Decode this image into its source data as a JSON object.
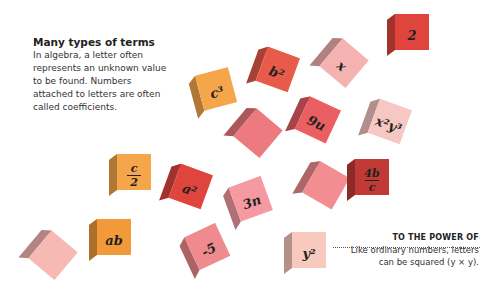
{
  "intro": {
    "title": "Many types of terms",
    "body": "In algebra, a letter often represents an unknown value to be found. Numbers attached to letters are often called coefficients."
  },
  "annotation": {
    "title": "TO THE POWER OF",
    "body": "Like ordinary numbers, letters can be squared (y × y)."
  },
  "cubes": [
    {
      "label": "2",
      "color": "#e0453d",
      "x": 385,
      "y": 12,
      "rot": 0
    },
    {
      "label": "b²",
      "color": "#e85a4a",
      "x": 250,
      "y": 48,
      "rot": 20
    },
    {
      "label": "x",
      "color": "#f4b3b0",
      "x": 316,
      "y": 40,
      "rot": 40
    },
    {
      "label": "c³",
      "color": "#f5a64a",
      "x": 190,
      "y": 70,
      "rot": -15
    },
    {
      "label": "9u",
      "color": "#ea5f62",
      "x": 290,
      "y": 98,
      "rot": 25
    },
    {
      "label": "x²y³",
      "color": "#f7c7c4",
      "x": 362,
      "y": 100,
      "rot": 20
    },
    {
      "label": "",
      "color": "#ed7a7e",
      "x": 230,
      "y": 110,
      "rot": 40
    },
    {
      "label": "c/2",
      "color": "#f5a64a",
      "x": 107,
      "y": 152,
      "rot": 0
    },
    {
      "label": "a²",
      "color": "#e0453d",
      "x": 163,
      "y": 165,
      "rot": 20
    },
    {
      "label": "3n",
      "color": "#f49aa0",
      "x": 225,
      "y": 180,
      "rot": -20
    },
    {
      "label": "",
      "color": "#f28d91",
      "x": 298,
      "y": 163,
      "rot": 30
    },
    {
      "label": "4b/c",
      "color": "#c23a35",
      "x": 345,
      "y": 157,
      "rot": 0
    },
    {
      "label": "ab",
      "color": "#f29a3a",
      "x": 87,
      "y": 217,
      "rot": 0
    },
    {
      "label": "",
      "color": "#f7b9b4",
      "x": 25,
      "y": 232,
      "rot": 40
    },
    {
      "label": "-5",
      "color": "#ef8a8e",
      "x": 182,
      "y": 228,
      "rot": -25
    },
    {
      "label": "y²",
      "color": "#f8c9bd",
      "x": 282,
      "y": 230,
      "rot": 0
    }
  ]
}
